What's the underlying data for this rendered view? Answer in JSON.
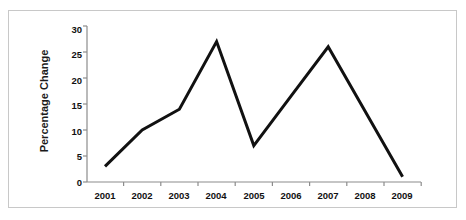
{
  "figure": {
    "frame_color": "#c8c8c8",
    "background": "#ffffff"
  },
  "chart_data": {
    "type": "line",
    "title": "",
    "xlabel": "",
    "ylabel": "Percentage Change",
    "x": [
      "2001",
      "2002",
      "2003",
      "2004",
      "2005",
      "2006",
      "2007",
      "2008",
      "2009"
    ],
    "categories": [
      "2001",
      "2002",
      "2003",
      "2004",
      "2005",
      "2006",
      "2007",
      "2008",
      "2009"
    ],
    "values": [
      3,
      10,
      14,
      27,
      7,
      16.5,
      26,
      13.5,
      1
    ],
    "series": [
      {
        "name": "Percentage Change",
        "values": [
          3,
          10,
          14,
          27,
          7,
          16.5,
          26,
          13.5,
          1
        ],
        "color": "#111111",
        "line_width": 3,
        "markers": "none"
      }
    ],
    "ylim": [
      0,
      30
    ],
    "yticks": [
      0,
      5,
      10,
      15,
      20,
      25,
      30
    ],
    "ytick_labels": [
      "0",
      "5",
      "10",
      "15",
      "20",
      "25",
      "30"
    ],
    "xtick_labels": [
      "2001",
      "2002",
      "2003",
      "2004",
      "2005",
      "2006",
      "2007",
      "2008",
      "2009"
    ],
    "grid": false,
    "legend": "none",
    "axis_color": "#8c8c8c",
    "vertex_years": [
      "2001",
      "2002",
      "2003",
      "2004",
      "2005",
      "2007",
      "2009"
    ]
  }
}
